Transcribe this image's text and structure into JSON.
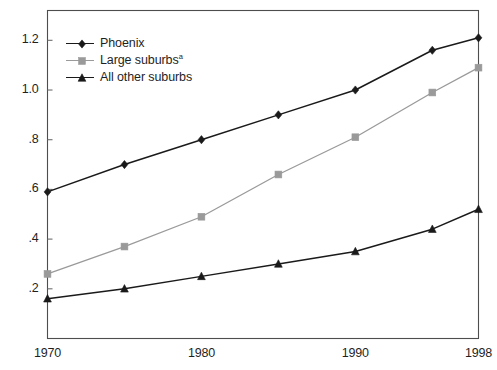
{
  "chart_data": {
    "type": "line",
    "title": "",
    "subtitle": "",
    "xlabel": "",
    "ylabel": "",
    "xlim": [
      1970,
      1998
    ],
    "ylim": [
      0,
      1.32
    ],
    "grid": false,
    "legend_position": "top-left",
    "x": [
      1970,
      1975,
      1980,
      1985,
      1990,
      1995,
      1998
    ],
    "xticks": [
      1970,
      1980,
      1990,
      1998
    ],
    "xticklabels": [
      "1970",
      "1980",
      "1990",
      "1998"
    ],
    "yticks": [
      0.2,
      0.4,
      0.6,
      0.8,
      1.0,
      1.2
    ],
    "yticklabels": [
      ".2",
      ".4",
      ".6",
      ".8",
      "1.0",
      "1.2"
    ],
    "series": [
      {
        "name": "Phoenix",
        "label": "Phoenix",
        "marker": "diamond",
        "color": "#1a1a1a",
        "values": [
          0.59,
          0.7,
          0.8,
          0.9,
          1.0,
          1.16,
          1.21
        ]
      },
      {
        "name": "Large suburbs",
        "label": "Large suburbs",
        "label_superscript": "a",
        "marker": "square",
        "color": "#9a9a9a",
        "values": [
          0.26,
          0.37,
          0.49,
          0.66,
          0.81,
          0.99,
          1.09
        ]
      },
      {
        "name": "All other suburbs",
        "label": "All other suburbs",
        "marker": "triangle",
        "color": "#1a1a1a",
        "values": [
          0.16,
          0.2,
          0.25,
          0.3,
          0.35,
          0.44,
          0.52
        ]
      }
    ]
  },
  "axes": {
    "frame_color": "#4d4d4d",
    "tick_color": "#6e6e6e"
  }
}
